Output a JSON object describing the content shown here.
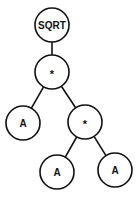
{
  "diagram": {
    "type": "expression-tree",
    "nodes": [
      {
        "id": "n0",
        "label": "SQRT",
        "x": 52,
        "y": 25,
        "r": 17,
        "fs": 10
      },
      {
        "id": "n1",
        "label": "*",
        "x": 52,
        "y": 72,
        "r": 17,
        "fs": 11
      },
      {
        "id": "n2",
        "label": "A",
        "x": 23,
        "y": 123,
        "r": 17,
        "fs": 10
      },
      {
        "id": "n3",
        "label": "*",
        "x": 85,
        "y": 122,
        "r": 17,
        "fs": 11
      },
      {
        "id": "n4",
        "label": "A",
        "x": 57,
        "y": 172,
        "r": 17,
        "fs": 10
      },
      {
        "id": "n5",
        "label": "A",
        "x": 115,
        "y": 170,
        "r": 17,
        "fs": 10
      }
    ],
    "edges": [
      {
        "from": "n0",
        "to": "n1"
      },
      {
        "from": "n1",
        "to": "n2"
      },
      {
        "from": "n1",
        "to": "n3"
      },
      {
        "from": "n3",
        "to": "n4"
      },
      {
        "from": "n3",
        "to": "n5"
      }
    ]
  }
}
